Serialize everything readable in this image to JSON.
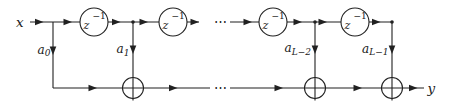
{
  "colors": {
    "ink": "#212121",
    "background": "#ffffff"
  },
  "io": {
    "input": "x",
    "output": "y"
  },
  "delays": [
    {
      "base": "z",
      "exponent": "−1"
    },
    {
      "base": "z",
      "exponent": "−1"
    },
    {
      "base": "z",
      "exponent": "−1"
    },
    {
      "base": "z",
      "exponent": "−1"
    }
  ],
  "taps": [
    {
      "base": "a",
      "subscript": "0"
    },
    {
      "base": "a",
      "subscript": "1"
    },
    {
      "base": "a",
      "subscript": "L−2"
    },
    {
      "base": "a",
      "subscript": "L−1"
    }
  ],
  "adders": {
    "count": 3,
    "icon": "⊕"
  },
  "ellipsis": {
    "top": "⋯",
    "bottom": "⋯"
  }
}
